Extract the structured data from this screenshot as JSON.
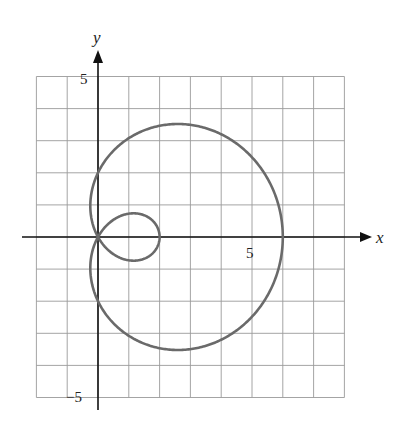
{
  "chart_data": {
    "type": "line",
    "title": "",
    "xlabel": "x",
    "ylabel": "y",
    "xlim": [
      -2,
      8
    ],
    "ylim": [
      -5,
      5
    ],
    "grid": true,
    "tick_labels": {
      "x": [
        "5"
      ],
      "y": [
        "5",
        "−5"
      ]
    },
    "series": [
      {
        "name": "limacon r = 2 + 4cosθ",
        "equation": "r = 2 + 4cos(theta)",
        "key_points": [
          [
            6,
            0
          ],
          [
            0,
            0
          ],
          [
            2,
            0
          ],
          [
            0,
            2
          ],
          [
            0,
            -2
          ]
        ],
        "color": "#666666"
      }
    ]
  },
  "axes": {
    "x_label": "x",
    "y_label": "y",
    "x_tick": "5",
    "y_tick_top": "5",
    "y_tick_bottom": "−5"
  }
}
